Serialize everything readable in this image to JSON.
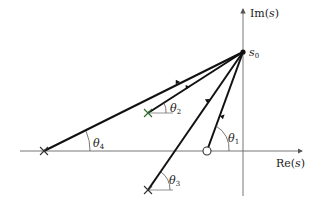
{
  "diagram": {
    "axes": {
      "imag_label": "Im(s)",
      "imag_label_main": "Im(",
      "imag_label_var": "s",
      "imag_label_close": ")",
      "real_label": "Re(s)",
      "real_label_main": "Re(",
      "real_label_var": "s",
      "real_label_close": ")"
    },
    "test_point": {
      "label": "s",
      "sub": "0"
    },
    "angles": [
      {
        "name": "theta1",
        "sym": "θ",
        "sub": "1",
        "from": "zero"
      },
      {
        "name": "theta2",
        "sym": "θ",
        "sub": "2",
        "from": "pole"
      },
      {
        "name": "theta3",
        "sym": "θ",
        "sub": "3",
        "from": "pole"
      },
      {
        "name": "theta4",
        "sym": "θ",
        "sub": "4",
        "from": "pole"
      }
    ],
    "poles": 3,
    "zeros": 1,
    "colors": {
      "line": "#111111",
      "axis": "#555555",
      "background": "#ffffff"
    }
  }
}
